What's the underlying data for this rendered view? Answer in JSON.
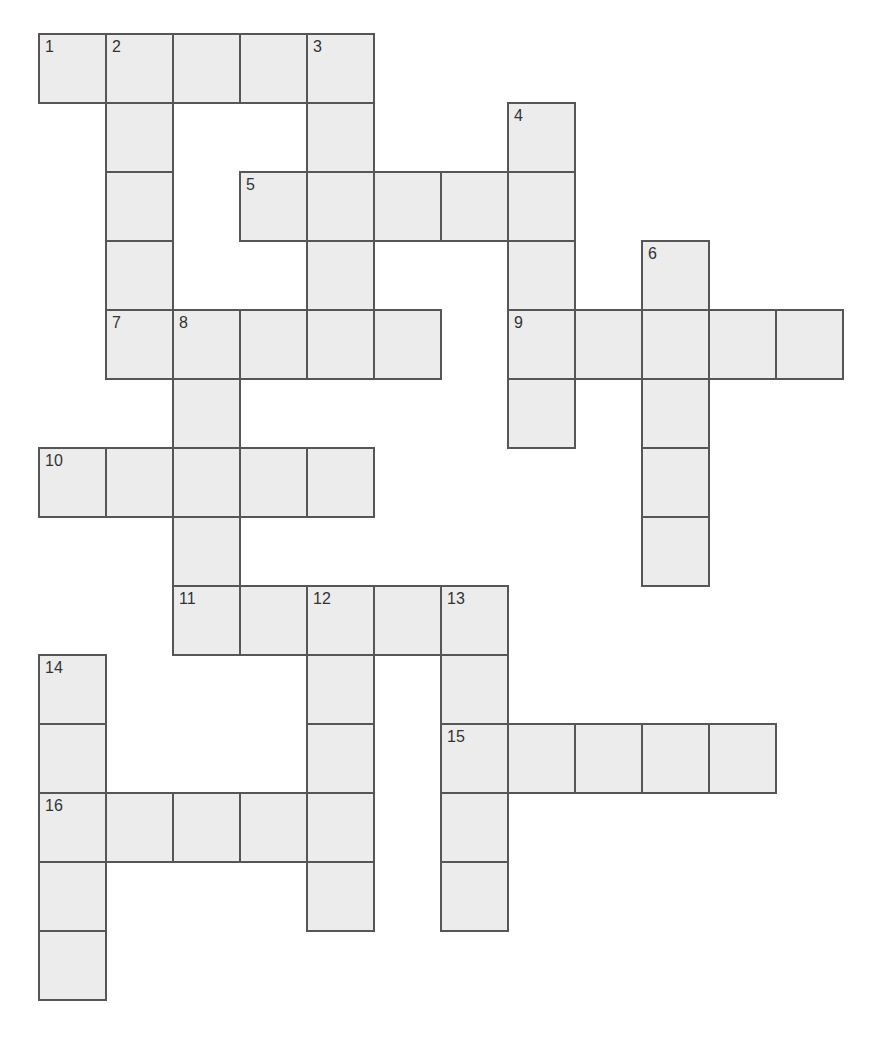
{
  "puzzle": {
    "type": "crossword",
    "grid_origin": {
      "x": 38,
      "y": 33
    },
    "cell_size": {
      "w": 67,
      "h": 69
    },
    "colors": {
      "cell_fill": "#ececec",
      "cell_border": "#565656",
      "number": "#333333",
      "background": "#ffffff"
    },
    "entries": [
      {
        "number": 1,
        "direction": "across",
        "row": 0,
        "col": 0,
        "length": 5
      },
      {
        "number": 2,
        "direction": "down",
        "row": 0,
        "col": 1,
        "length": 5
      },
      {
        "number": 3,
        "direction": "down",
        "row": 0,
        "col": 4,
        "length": 5
      },
      {
        "number": 4,
        "direction": "down",
        "row": 1,
        "col": 7,
        "length": 5
      },
      {
        "number": 5,
        "direction": "across",
        "row": 2,
        "col": 3,
        "length": 5
      },
      {
        "number": 6,
        "direction": "down",
        "row": 3,
        "col": 9,
        "length": 5
      },
      {
        "number": 7,
        "direction": "across",
        "row": 4,
        "col": 1,
        "length": 5
      },
      {
        "number": 8,
        "direction": "down",
        "row": 4,
        "col": 2,
        "length": 5
      },
      {
        "number": 9,
        "direction": "across",
        "row": 4,
        "col": 7,
        "length": 5
      },
      {
        "number": 10,
        "direction": "across",
        "row": 6,
        "col": 0,
        "length": 5
      },
      {
        "number": 11,
        "direction": "across",
        "row": 8,
        "col": 2,
        "length": 5
      },
      {
        "number": 12,
        "direction": "down",
        "row": 8,
        "col": 4,
        "length": 5
      },
      {
        "number": 13,
        "direction": "down",
        "row": 8,
        "col": 6,
        "length": 5
      },
      {
        "number": 14,
        "direction": "down",
        "row": 9,
        "col": 0,
        "length": 5
      },
      {
        "number": 15,
        "direction": "across",
        "row": 10,
        "col": 6,
        "length": 5
      },
      {
        "number": 16,
        "direction": "across",
        "row": 11,
        "col": 0,
        "length": 5
      }
    ]
  }
}
